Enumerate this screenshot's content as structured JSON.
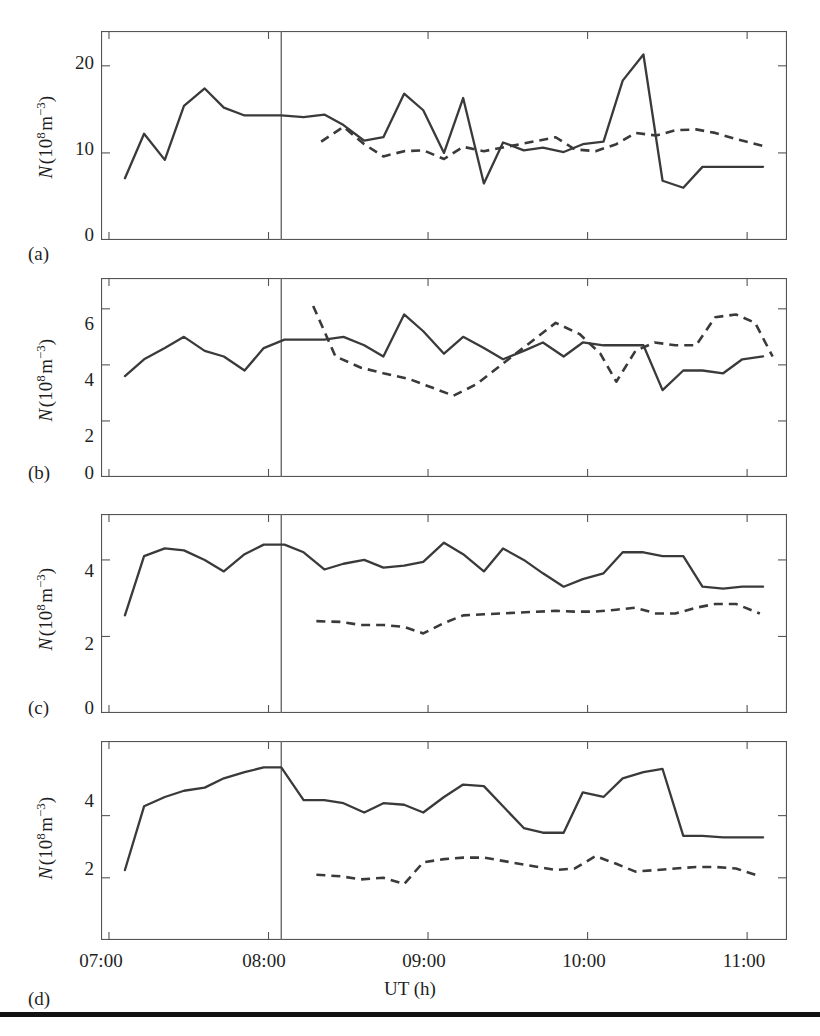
{
  "figure": {
    "x_axis_title": "UT (h)",
    "x_tick_labels": [
      "07:00",
      "08:00",
      "09:00",
      "10:00",
      "11:00"
    ],
    "x_tick_values": [
      7.0,
      8.0,
      9.0,
      10.0,
      11.0
    ],
    "x_range": [
      6.95,
      11.25
    ],
    "y_axis_label_text": "N (10^8 m^-3)",
    "panel_captions": [
      "(a)",
      "(b)",
      "(c)",
      "(d)"
    ],
    "marker_line_label": "08:05",
    "marker_line_value": 8.08,
    "line_color": "#3a3a3a",
    "frame_color": "#555555",
    "background_color": "#ffffff"
  },
  "chart_data": [
    {
      "type": "line",
      "panel": "(a)",
      "title": "",
      "xlabel": "UT (h)",
      "ylabel": "N (10^8 m^-3)",
      "xlim": [
        6.95,
        11.25
      ],
      "ylim": [
        0,
        24
      ],
      "yticks": [
        0,
        10,
        20
      ],
      "ytick_labels": [
        "0",
        "10",
        "20"
      ],
      "xticks": [
        7.0,
        8.0,
        9.0,
        10.0,
        11.0
      ],
      "grid": false,
      "legend": "none",
      "vertical_marker": 8.08,
      "series": [
        {
          "name": "solid",
          "style": "solid",
          "x": [
            7.1,
            7.22,
            7.35,
            7.47,
            7.6,
            7.72,
            7.85,
            7.97,
            8.08,
            8.22,
            8.35,
            8.47,
            8.6,
            8.72,
            8.85,
            8.97,
            9.1,
            9.22,
            9.35,
            9.47,
            9.6,
            9.72,
            9.85,
            9.97,
            10.1,
            10.22,
            10.35,
            10.47,
            10.6,
            10.72,
            10.85,
            10.97,
            11.1
          ],
          "y": [
            7.1,
            12.2,
            9.2,
            15.4,
            17.4,
            15.2,
            14.3,
            14.3,
            14.3,
            14.1,
            14.4,
            13.2,
            11.4,
            11.8,
            16.8,
            14.9,
            10.0,
            16.3,
            6.5,
            11.2,
            10.3,
            10.6,
            10.1,
            11.0,
            11.3,
            18.3,
            21.3,
            6.8,
            6.0,
            8.4,
            8.4,
            8.4,
            8.4
          ]
        },
        {
          "name": "dashed",
          "style": "dashed",
          "x": [
            8.33,
            8.47,
            8.6,
            8.72,
            8.85,
            8.97,
            9.1,
            9.22,
            9.35,
            9.8,
            9.92,
            10.05,
            10.18,
            10.3,
            10.43,
            10.55,
            10.68,
            10.8,
            10.93,
            11.1
          ],
          "y": [
            11.3,
            13.0,
            11.0,
            9.6,
            10.2,
            10.3,
            9.3,
            10.7,
            10.2,
            11.8,
            10.4,
            10.2,
            11.0,
            12.3,
            12.0,
            12.6,
            12.7,
            12.3,
            11.6,
            10.8
          ]
        }
      ]
    },
    {
      "type": "line",
      "panel": "(b)",
      "title": "",
      "xlabel": "UT (h)",
      "ylabel": "N (10^8 m^-3)",
      "xlim": [
        6.95,
        11.25
      ],
      "ylim": [
        0,
        7.1
      ],
      "yticks": [
        0,
        2,
        4,
        6
      ],
      "ytick_labels": [
        "0",
        "2",
        "4",
        "6"
      ],
      "xticks": [
        7.0,
        8.0,
        9.0,
        10.0,
        11.0
      ],
      "grid": false,
      "legend": "none",
      "vertical_marker": 8.08,
      "series": [
        {
          "name": "solid",
          "style": "solid",
          "x": [
            7.1,
            7.22,
            7.35,
            7.47,
            7.6,
            7.72,
            7.85,
            7.97,
            8.1,
            8.22,
            8.35,
            8.47,
            8.6,
            8.72,
            8.85,
            8.97,
            9.1,
            9.22,
            9.35,
            9.47,
            9.6,
            9.72,
            9.85,
            9.97,
            10.1,
            10.22,
            10.35,
            10.47,
            10.6,
            10.72,
            10.85,
            10.97,
            11.1
          ],
          "y": [
            3.6,
            4.2,
            4.6,
            5.0,
            4.5,
            4.3,
            3.8,
            4.6,
            4.9,
            4.9,
            4.9,
            5.0,
            4.7,
            4.3,
            5.8,
            5.2,
            4.4,
            5.0,
            4.6,
            4.2,
            4.5,
            4.8,
            4.3,
            4.8,
            4.7,
            4.7,
            4.7,
            3.1,
            3.8,
            3.8,
            3.7,
            4.2,
            4.3
          ]
        },
        {
          "name": "dashed",
          "style": "dashed",
          "x": [
            8.28,
            8.42,
            8.58,
            8.72,
            8.88,
            9.02,
            9.16,
            9.3,
            9.8,
            9.95,
            10.08,
            10.18,
            10.3,
            10.42,
            10.55,
            10.68,
            10.8,
            10.93,
            11.05,
            11.16
          ],
          "y": [
            6.1,
            4.3,
            3.9,
            3.7,
            3.5,
            3.2,
            2.9,
            3.3,
            5.5,
            5.1,
            4.4,
            3.4,
            4.5,
            4.8,
            4.7,
            4.7,
            5.7,
            5.8,
            5.5,
            4.3
          ]
        }
      ]
    },
    {
      "type": "line",
      "panel": "(c)",
      "title": "",
      "xlabel": "UT (h)",
      "ylabel": "N (10^8 m^-3)",
      "xlim": [
        6.95,
        11.25
      ],
      "ylim": [
        0,
        5.2
      ],
      "yticks": [
        0,
        2,
        4
      ],
      "ytick_labels": [
        "0",
        "2",
        "4"
      ],
      "xticks": [
        7.0,
        8.0,
        9.0,
        10.0,
        11.0
      ],
      "grid": false,
      "legend": "none",
      "vertical_marker": 8.08,
      "series": [
        {
          "name": "solid",
          "style": "solid",
          "x": [
            7.1,
            7.22,
            7.35,
            7.47,
            7.6,
            7.72,
            7.85,
            7.97,
            8.1,
            8.22,
            8.35,
            8.47,
            8.6,
            8.72,
            8.85,
            8.97,
            9.1,
            9.22,
            9.35,
            9.47,
            9.6,
            9.72,
            9.85,
            9.97,
            10.1,
            10.22,
            10.35,
            10.47,
            10.6,
            10.72,
            10.85,
            10.97,
            11.1
          ],
          "y": [
            2.55,
            4.1,
            4.3,
            4.25,
            4.0,
            3.7,
            4.15,
            4.4,
            4.4,
            4.2,
            3.75,
            3.9,
            4.0,
            3.8,
            3.85,
            3.95,
            4.45,
            4.15,
            3.7,
            4.3,
            4.0,
            3.65,
            3.3,
            3.5,
            3.65,
            4.2,
            4.2,
            4.1,
            4.1,
            3.3,
            3.25,
            3.3,
            3.3
          ]
        },
        {
          "name": "dashed",
          "style": "dashed",
          "x": [
            8.3,
            8.45,
            8.58,
            8.72,
            8.85,
            8.97,
            9.1,
            9.22,
            9.35,
            9.8,
            9.92,
            10.05,
            10.18,
            10.3,
            10.43,
            10.55,
            10.68,
            10.8,
            10.93,
            11.08
          ],
          "y": [
            2.4,
            2.38,
            2.3,
            2.3,
            2.25,
            2.08,
            2.35,
            2.55,
            2.58,
            2.67,
            2.65,
            2.65,
            2.7,
            2.75,
            2.6,
            2.6,
            2.75,
            2.85,
            2.85,
            2.6
          ]
        }
      ]
    },
    {
      "type": "line",
      "panel": "(d)",
      "title": "",
      "xlabel": "UT (h)",
      "ylabel": "N (10^8 m^-3)",
      "xlim": [
        6.95,
        11.25
      ],
      "ylim": [
        0,
        6.4
      ],
      "yticks": [
        2,
        4
      ],
      "ytick_labels": [
        "2",
        "4"
      ],
      "xticks": [
        7.0,
        8.0,
        9.0,
        10.0,
        11.0
      ],
      "grid": false,
      "legend": "none",
      "vertical_marker": 8.08,
      "series": [
        {
          "name": "solid",
          "style": "solid",
          "x": [
            7.1,
            7.22,
            7.35,
            7.47,
            7.6,
            7.72,
            7.85,
            7.97,
            8.08,
            8.22,
            8.35,
            8.47,
            8.6,
            8.72,
            8.85,
            8.97,
            9.1,
            9.22,
            9.35,
            9.47,
            9.6,
            9.72,
            9.85,
            9.97,
            10.1,
            10.22,
            10.35,
            10.47,
            10.6,
            10.72,
            10.85,
            10.97,
            11.1
          ],
          "y": [
            2.25,
            4.3,
            4.6,
            4.8,
            4.9,
            5.2,
            5.4,
            5.55,
            5.55,
            4.5,
            4.5,
            4.4,
            4.1,
            4.4,
            4.35,
            4.1,
            4.6,
            5.0,
            4.95,
            4.3,
            3.6,
            3.45,
            3.45,
            4.75,
            4.6,
            5.2,
            5.4,
            5.5,
            3.35,
            3.35,
            3.3,
            3.3,
            3.3
          ]
        },
        {
          "name": "dashed",
          "style": "dashed",
          "x": [
            8.3,
            8.45,
            8.58,
            8.72,
            8.85,
            8.97,
            9.1,
            9.22,
            9.35,
            9.8,
            9.92,
            10.05,
            10.18,
            10.3,
            10.43,
            10.55,
            10.68,
            10.8,
            10.93,
            11.08
          ],
          "y": [
            2.1,
            2.05,
            1.95,
            2.0,
            1.8,
            2.5,
            2.6,
            2.65,
            2.65,
            2.25,
            2.3,
            2.7,
            2.45,
            2.2,
            2.25,
            2.3,
            2.35,
            2.35,
            2.3,
            2.05
          ]
        }
      ]
    }
  ]
}
